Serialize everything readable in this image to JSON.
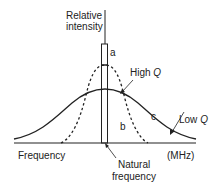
{
  "diagram": {
    "y_axis_label_line1": "Relative",
    "y_axis_label_line2": "intensity",
    "x_axis_label": "Frequency",
    "x_axis_unit": "(MHz)",
    "center_label_line1": "Natural",
    "center_label_line2": "frequency",
    "curves": {
      "a": "a",
      "b": "b",
      "c": "c"
    },
    "high_q_label": "High",
    "low_q_label": "Low",
    "q_symbol": "Q"
  }
}
